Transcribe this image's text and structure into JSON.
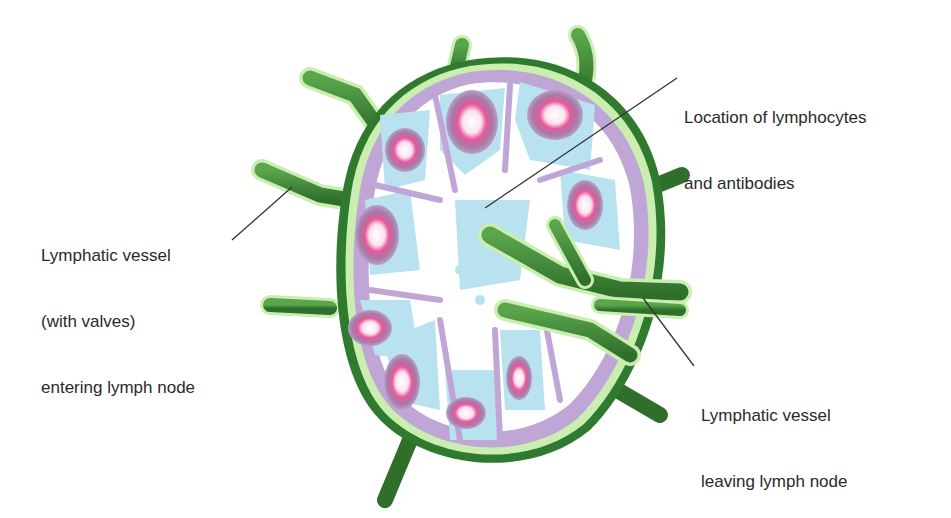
{
  "diagram": {
    "labels": [
      {
        "id": "lymphocytes",
        "lines": [
          "Location of lymphocytes",
          "and antibodies"
        ]
      },
      {
        "id": "afferent",
        "lines": [
          "Lymphatic vessel",
          "(with valves)",
          "entering lymph node"
        ]
      },
      {
        "id": "efferent",
        "lines": [
          "Lymphatic vessel",
          "leaving lymph node"
        ]
      }
    ],
    "colors": {
      "vessel": "#3f8a36",
      "vessel_dark": "#2e6e2a",
      "capsule_edge": "#c9eeb0",
      "cortex": "#bfa6d6",
      "sinus": "#ffffff",
      "follicle": "#b9e2f0",
      "germinal_outer": "#a77aa6",
      "germinal_inner": "#e85a9a",
      "leader_line": "#333333",
      "text": "#2a2a2a"
    }
  }
}
